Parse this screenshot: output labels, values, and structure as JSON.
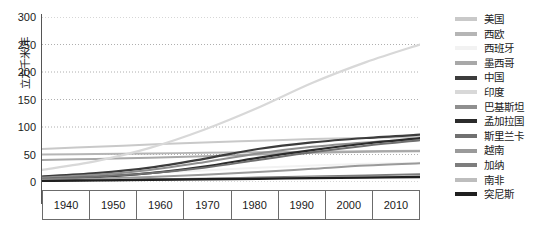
{
  "chart_data": {
    "type": "line",
    "title": "",
    "xlabel": "",
    "ylabel": "立方千米/年",
    "x": [
      1940,
      1950,
      1960,
      1970,
      1980,
      1990,
      2000,
      2010
    ],
    "xtick_labels": [
      "1940",
      "1950",
      "1960",
      "1970",
      "1980",
      "1990",
      "2000",
      "2010"
    ],
    "ytick_labels": [
      "0",
      "50",
      "100",
      "150",
      "200",
      "250",
      "300"
    ],
    "ytick_values": [
      0,
      50,
      100,
      150,
      200,
      250,
      300
    ],
    "ylim": [
      0,
      300
    ],
    "xlim": [
      1940,
      2010
    ],
    "grid": "horizontal-dotted",
    "legend_position": "right",
    "series": [
      {
        "name": "美国",
        "color": "#c9c9c9",
        "width": 2.0,
        "values": [
          60,
          64,
          68,
          72,
          75,
          78,
          80,
          82
        ]
      },
      {
        "name": "西欧",
        "color": "#b5b5b5",
        "width": 2.0,
        "values": [
          50,
          51,
          52,
          53,
          54,
          55,
          56,
          57
        ]
      },
      {
        "name": "西班牙",
        "color": "#f2f2f2",
        "width": 2.0,
        "values": [
          10,
          13,
          17,
          21,
          26,
          30,
          33,
          35
        ]
      },
      {
        "name": "墨西哥",
        "color": "#a8a8a8",
        "width": 2.0,
        "values": [
          40,
          42,
          44,
          47,
          50,
          53,
          55,
          56
        ]
      },
      {
        "name": "中国",
        "color": "#3c3c3c",
        "width": 2.2,
        "values": [
          10,
          16,
          26,
          42,
          60,
          72,
          80,
          86
        ]
      },
      {
        "name": "印度",
        "color": "#d8d8d8",
        "width": 2.2,
        "values": [
          22,
          38,
          62,
          95,
          135,
          180,
          218,
          250
        ]
      },
      {
        "name": "巴基斯坦",
        "color": "#8f8f8f",
        "width": 2.0,
        "values": [
          8,
          13,
          22,
          36,
          52,
          64,
          72,
          78
        ]
      },
      {
        "name": "孟加拉国",
        "color": "#2b2b2b",
        "width": 2.2,
        "values": [
          5,
          9,
          16,
          28,
          44,
          58,
          70,
          80
        ]
      },
      {
        "name": "斯里兰卡",
        "color": "#707070",
        "width": 2.0,
        "values": [
          6,
          10,
          16,
          26,
          40,
          54,
          66,
          76
        ]
      },
      {
        "name": "越南",
        "color": "#9a9a9a",
        "width": 2.0,
        "values": [
          4,
          6,
          9,
          13,
          18,
          24,
          30,
          34
        ]
      },
      {
        "name": "加纳",
        "color": "#7d7d7d",
        "width": 2.0,
        "values": [
          2,
          3,
          4,
          6,
          8,
          10,
          12,
          14
        ]
      },
      {
        "name": "南非",
        "color": "#bdbdbd",
        "width": 2.0,
        "values": [
          3,
          4,
          5,
          6,
          7,
          8,
          9,
          10
        ]
      },
      {
        "name": "突尼斯",
        "color": "#1f1f1f",
        "width": 2.4,
        "values": [
          2,
          3,
          4,
          5,
          6,
          7,
          8,
          9
        ]
      }
    ]
  },
  "axis_color": "#555555",
  "grid_color": "#9a9a9a"
}
